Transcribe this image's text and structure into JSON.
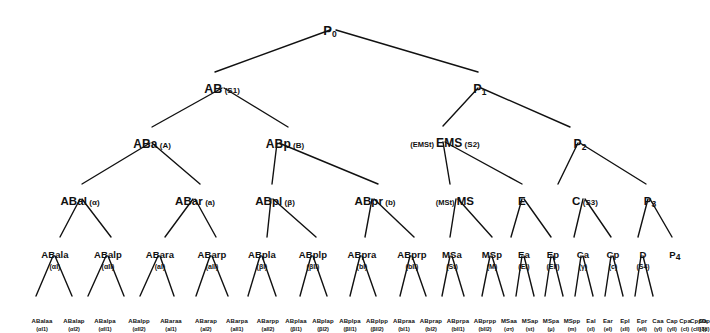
{
  "diagram": {
    "type": "tree",
    "line_color": "#111111",
    "text_color": "#111111",
    "background": "#ffffff"
  },
  "nodes": [
    {
      "id": "P0",
      "label": "P",
      "sub": "0",
      "alias": "",
      "alias_pre": "",
      "x": 330,
      "y": 22,
      "level": 0
    },
    {
      "id": "AB",
      "label": "AB",
      "sub": "",
      "alias": "(S1)",
      "alias_pre": "",
      "x": 222,
      "y": 80,
      "level": 1
    },
    {
      "id": "P1",
      "label": "P",
      "sub": "1",
      "alias": "",
      "alias_pre": "",
      "x": 480,
      "y": 80,
      "level": 1
    },
    {
      "id": "ABa",
      "label": "ABa",
      "sub": "",
      "alias": "(A)",
      "alias_pre": "",
      "x": 152,
      "y": 135,
      "level": 2
    },
    {
      "id": "ABp",
      "label": "ABp",
      "sub": "",
      "alias": "(B)",
      "alias_pre": "",
      "x": 285,
      "y": 135,
      "level": 2
    },
    {
      "id": "EMS",
      "label": "EMS",
      "sub": "",
      "alias": "(S2)",
      "alias_pre": "(EMSt)",
      "x": 445,
      "y": 134,
      "level": 2
    },
    {
      "id": "P2",
      "label": "P",
      "sub": "2",
      "alias": "",
      "alias_pre": "",
      "x": 580,
      "y": 135,
      "level": 2
    },
    {
      "id": "ABal",
      "label": "ABal",
      "sub": "",
      "alias": "(α)",
      "alias_pre": "",
      "x": 80,
      "y": 192,
      "level": 3
    },
    {
      "id": "ABar",
      "label": "ABar",
      "sub": "",
      "alias": "(a)",
      "alias_pre": "",
      "x": 195,
      "y": 192,
      "level": 3
    },
    {
      "id": "ABpl",
      "label": "ABpl",
      "sub": "",
      "alias": "(β)",
      "alias_pre": "",
      "x": 275,
      "y": 192,
      "level": 3
    },
    {
      "id": "ABpr",
      "label": "ABpr",
      "sub": "",
      "alias": "(b)",
      "alias_pre": "",
      "x": 375,
      "y": 192,
      "level": 3
    },
    {
      "id": "MS",
      "label": "MS",
      "sub": "",
      "alias": "",
      "alias_pre": "(MSt)",
      "x": 455,
      "y": 192,
      "level": 3
    },
    {
      "id": "E",
      "label": "E",
      "sub": "",
      "alias": "",
      "alias_pre": "",
      "x": 522,
      "y": 192,
      "level": 3
    },
    {
      "id": "C",
      "label": "C",
      "sub": "",
      "alias": "(S3)",
      "alias_pre": "",
      "x": 585,
      "y": 192,
      "level": 3
    },
    {
      "id": "P3",
      "label": "P",
      "sub": "3",
      "alias": "",
      "alias_pre": "",
      "x": 650,
      "y": 192,
      "level": 3
    },
    {
      "id": "ABala",
      "label": "ABala",
      "sub": "",
      "alias": "(αI)",
      "alias_pre": "",
      "x": 55,
      "y": 245,
      "level": 4
    },
    {
      "id": "ABalp",
      "label": "ABalp",
      "sub": "",
      "alias": "(αII)",
      "alias_pre": "",
      "x": 108,
      "y": 245,
      "level": 4
    },
    {
      "id": "ABara",
      "label": "ABara",
      "sub": "",
      "alias": "(aI)",
      "alias_pre": "",
      "x": 160,
      "y": 245,
      "level": 4
    },
    {
      "id": "ABarp",
      "label": "ABarp",
      "sub": "",
      "alias": "(aII)",
      "alias_pre": "",
      "x": 212,
      "y": 245,
      "level": 4
    },
    {
      "id": "ABpla",
      "label": "ABpla",
      "sub": "",
      "alias": "(βI)",
      "alias_pre": "",
      "x": 262,
      "y": 245,
      "level": 4
    },
    {
      "id": "ABplp",
      "label": "ABplp",
      "sub": "",
      "alias": "(βII)",
      "alias_pre": "",
      "x": 313,
      "y": 245,
      "level": 4
    },
    {
      "id": "ABpra",
      "label": "ABpra",
      "sub": "",
      "alias": "(bI)",
      "alias_pre": "",
      "x": 362,
      "y": 245,
      "level": 4
    },
    {
      "id": "ABprp",
      "label": "ABprp",
      "sub": "",
      "alias": "(bII)",
      "alias_pre": "",
      "x": 412,
      "y": 245,
      "level": 4
    },
    {
      "id": "MSa",
      "label": "MSa",
      "sub": "",
      "alias": "(St)",
      "alias_pre": "",
      "x": 452,
      "y": 245,
      "level": 4
    },
    {
      "id": "MSp",
      "label": "MSp",
      "sub": "",
      "alias": "(M)",
      "alias_pre": "",
      "x": 492,
      "y": 245,
      "level": 4
    },
    {
      "id": "Ea",
      "label": "Ea",
      "sub": "",
      "alias": "(EI)",
      "alias_pre": "",
      "x": 524,
      "y": 245,
      "level": 4
    },
    {
      "id": "Ep",
      "label": "Ep",
      "sub": "",
      "alias": "(EII)",
      "alias_pre": "",
      "x": 553,
      "y": 245,
      "level": 4
    },
    {
      "id": "Ca",
      "label": "Ca",
      "sub": "",
      "alias": "(γ)",
      "alias_pre": "",
      "x": 583,
      "y": 245,
      "level": 4
    },
    {
      "id": "Cp",
      "label": "Cp",
      "sub": "",
      "alias": "(c)",
      "alias_pre": "",
      "x": 613,
      "y": 245,
      "level": 4
    },
    {
      "id": "D",
      "label": "D",
      "sub": "",
      "alias": "(S4)",
      "alias_pre": "",
      "x": 643,
      "y": 245,
      "level": 4
    },
    {
      "id": "P4",
      "label": "P",
      "sub": "4",
      "alias": "",
      "alias_pre": "",
      "x": 675,
      "y": 245,
      "level": 4
    },
    {
      "id": "ABalaa",
      "label": "ABalaa",
      "alias": "(αI1)",
      "x": 42,
      "y": 310,
      "level": 5
    },
    {
      "id": "ABalap",
      "label": "ABalap",
      "alias": "(αI2)",
      "x": 74,
      "y": 310,
      "level": 5
    },
    {
      "id": "ABalpa",
      "label": "ABalpa",
      "alias": "(αII1)",
      "x": 105,
      "y": 310,
      "level": 5
    },
    {
      "id": "ABalpp",
      "label": "ABalpp",
      "alias": "(αII2)",
      "x": 139,
      "y": 310,
      "level": 5
    },
    {
      "id": "ABaraa",
      "label": "ABaraa",
      "alias": "(aI1)",
      "x": 171,
      "y": 310,
      "level": 5
    },
    {
      "id": "ABarap",
      "label": "ABarap",
      "alias": "(aI2)",
      "x": 206,
      "y": 310,
      "level": 5
    },
    {
      "id": "ABarpa",
      "label": "ABarpa",
      "alias": "(aII1)",
      "x": 237,
      "y": 310,
      "level": 5
    },
    {
      "id": "ABarpp",
      "label": "ABarpp",
      "alias": "(aII2)",
      "x": 268,
      "y": 310,
      "level": 5
    },
    {
      "id": "ABplaa",
      "label": "ABplaa",
      "alias": "(βI1)",
      "x": 296,
      "y": 310,
      "level": 5
    },
    {
      "id": "ABplap",
      "label": "ABplap",
      "alias": "(βI2)",
      "x": 323,
      "y": 310,
      "level": 5
    },
    {
      "id": "ABplpa",
      "label": "ABplpa",
      "alias": "(βII1)",
      "x": 350,
      "y": 310,
      "level": 5
    },
    {
      "id": "ABplpp",
      "label": "ABplpp",
      "alias": "(βII2)",
      "x": 377,
      "y": 310,
      "level": 5
    },
    {
      "id": "ABpraa",
      "label": "ABpraa",
      "alias": "(bI1)",
      "x": 404,
      "y": 310,
      "level": 5
    },
    {
      "id": "ABprap",
      "label": "ABprap",
      "alias": "(bI2)",
      "x": 431,
      "y": 310,
      "level": 5
    },
    {
      "id": "ABprpa",
      "label": "ABprpa",
      "alias": "(bII1)",
      "x": 458,
      "y": 310,
      "level": 5
    },
    {
      "id": "ABprpp",
      "label": "ABprpp",
      "alias": "(bII2)",
      "x": 485,
      "y": 310,
      "level": 5
    },
    {
      "id": "MSaa",
      "label": "MSaa",
      "alias": "(στ)",
      "x": 509,
      "y": 310,
      "level": 5
    },
    {
      "id": "MSap",
      "label": "MSap",
      "alias": "(st)",
      "x": 530,
      "y": 310,
      "level": 5
    },
    {
      "id": "MSpa",
      "label": "MSpa",
      "alias": "(μ)",
      "x": 551,
      "y": 310,
      "level": 5
    },
    {
      "id": "MSpp",
      "label": "MSpp",
      "alias": "(m)",
      "x": 572,
      "y": 310,
      "level": 5
    },
    {
      "id": "Eal",
      "label": "Eal",
      "alias": "(εI)",
      "x": 591,
      "y": 310,
      "level": 5
    },
    {
      "id": "Ear",
      "label": "Ear",
      "alias": "(eI)",
      "x": 608,
      "y": 310,
      "level": 5
    },
    {
      "id": "Epl",
      "label": "Epl",
      "alias": "(εII)",
      "x": 625,
      "y": 310,
      "level": 5
    },
    {
      "id": "Epr",
      "label": "Epr",
      "alias": "(eII)",
      "x": 642,
      "y": 310,
      "level": 5
    },
    {
      "id": "Caa",
      "label": "Caa",
      "alias": "(γI)",
      "x": 658,
      "y": 310,
      "level": 5
    },
    {
      "id": "Cap",
      "label": "Cap",
      "alias": "(γII)",
      "x": 672,
      "y": 310,
      "level": 5
    },
    {
      "id": "Cpa",
      "label": "Cpa",
      "alias": "(cI)",
      "x": 685,
      "y": 310,
      "level": 5
    },
    {
      "id": "Cpp",
      "label": "Cpp",
      "alias": "(cII)",
      "x": 696,
      "y": 310,
      "level": 5
    },
    {
      "id": "Da",
      "label": "Da",
      "alias": "(δ)",
      "x": 703,
      "y": 310,
      "level": 5
    },
    {
      "id": "Dp",
      "label": "Dp",
      "alias": "(d)",
      "x": 706,
      "y": 310,
      "level": 5
    }
  ],
  "edges": [
    {
      "from": "P0",
      "to": "AB",
      "x1": 330,
      "y1": 30,
      "x2": 215,
      "y2": 72
    },
    {
      "from": "P0",
      "to": "P1",
      "x1": 336,
      "y1": 30,
      "x2": 478,
      "y2": 72
    },
    {
      "from": "AB",
      "to": "ABa",
      "x1": 222,
      "y1": 88,
      "x2": 152,
      "y2": 127
    },
    {
      "from": "AB",
      "to": "ABp",
      "x1": 224,
      "y1": 88,
      "x2": 288,
      "y2": 127
    },
    {
      "from": "P1",
      "to": "EMS",
      "x1": 478,
      "y1": 88,
      "x2": 443,
      "y2": 126
    },
    {
      "from": "P1",
      "to": "P2",
      "x1": 481,
      "y1": 88,
      "x2": 570,
      "y2": 127
    },
    {
      "from": "ABa",
      "to": "ABal",
      "x1": 150,
      "y1": 143,
      "x2": 82,
      "y2": 184
    },
    {
      "from": "ABa",
      "to": "ABar",
      "x1": 152,
      "y1": 143,
      "x2": 200,
      "y2": 184
    },
    {
      "from": "ABp",
      "to": "ABpl",
      "x1": 277,
      "y1": 143,
      "x2": 272,
      "y2": 184
    },
    {
      "from": "ABp",
      "to": "ABpr",
      "x1": 279,
      "y1": 143,
      "x2": 378,
      "y2": 184
    },
    {
      "from": "EMS",
      "to": "MS",
      "x1": 443,
      "y1": 142,
      "x2": 450,
      "y2": 184
    },
    {
      "from": "EMS",
      "to": "E",
      "x1": 445,
      "y1": 142,
      "x2": 522,
      "y2": 184
    },
    {
      "from": "P2",
      "to": "C",
      "x1": 578,
      "y1": 143,
      "x2": 558,
      "y2": 184
    },
    {
      "from": "P2",
      "to": "P3",
      "x1": 580,
      "y1": 143,
      "x2": 646,
      "y2": 184
    },
    {
      "from": "ABal",
      "to": "ABala",
      "x1": 80,
      "y1": 199,
      "x2": 60,
      "y2": 237
    },
    {
      "from": "ABal",
      "to": "ABalp",
      "x1": 82,
      "y1": 199,
      "x2": 111,
      "y2": 237
    },
    {
      "from": "ABar",
      "to": "ABara",
      "x1": 193,
      "y1": 199,
      "x2": 165,
      "y2": 237
    },
    {
      "from": "ABar",
      "to": "ABarp",
      "x1": 195,
      "y1": 199,
      "x2": 216,
      "y2": 237
    },
    {
      "from": "ABpl",
      "to": "ABpla",
      "x1": 271,
      "y1": 199,
      "x2": 267,
      "y2": 237
    },
    {
      "from": "ABpl",
      "to": "ABplp",
      "x1": 273,
      "y1": 199,
      "x2": 316,
      "y2": 237
    },
    {
      "from": "ABpr",
      "to": "ABpra",
      "x1": 372,
      "y1": 199,
      "x2": 365,
      "y2": 237
    },
    {
      "from": "ABpr",
      "to": "ABprp",
      "x1": 374,
      "y1": 199,
      "x2": 414,
      "y2": 237
    },
    {
      "from": "MS",
      "to": "MSa",
      "x1": 456,
      "y1": 199,
      "x2": 450,
      "y2": 237
    },
    {
      "from": "MS",
      "to": "MSp",
      "x1": 458,
      "y1": 199,
      "x2": 492,
      "y2": 237
    },
    {
      "from": "E",
      "to": "Ea",
      "x1": 522,
      "y1": 199,
      "x2": 511,
      "y2": 237
    },
    {
      "from": "E",
      "to": "Ep",
      "x1": 524,
      "y1": 199,
      "x2": 551,
      "y2": 237
    },
    {
      "from": "C",
      "to": "Ca",
      "x1": 583,
      "y1": 199,
      "x2": 574,
      "y2": 237
    },
    {
      "from": "C",
      "to": "Cp",
      "x1": 585,
      "y1": 199,
      "x2": 611,
      "y2": 237
    },
    {
      "from": "P3",
      "to": "D",
      "x1": 648,
      "y1": 199,
      "x2": 638,
      "y2": 237
    },
    {
      "from": "P3",
      "to": "P4",
      "x1": 650,
      "y1": 199,
      "x2": 672,
      "y2": 237
    },
    {
      "from": "ABala",
      "to": "ABalaa",
      "x1": 53,
      "y1": 256,
      "x2": 36,
      "y2": 296
    },
    {
      "from": "ABala",
      "to": "ABalap",
      "x1": 55,
      "y1": 256,
      "x2": 72,
      "y2": 296
    },
    {
      "from": "ABalp",
      "to": "ABalpa",
      "x1": 106,
      "y1": 256,
      "x2": 88,
      "y2": 296
    },
    {
      "from": "ABalp",
      "to": "ABalpp",
      "x1": 108,
      "y1": 256,
      "x2": 124,
      "y2": 296
    },
    {
      "from": "ABara",
      "to": "ABaraa",
      "x1": 158,
      "y1": 256,
      "x2": 140,
      "y2": 296
    },
    {
      "from": "ABara",
      "to": "ABarap",
      "x1": 160,
      "y1": 256,
      "x2": 174,
      "y2": 296
    },
    {
      "from": "ABarp",
      "to": "ABarpa",
      "x1": 210,
      "y1": 256,
      "x2": 196,
      "y2": 296
    },
    {
      "from": "ABarp",
      "to": "ABarpp",
      "x1": 212,
      "y1": 256,
      "x2": 228,
      "y2": 296
    },
    {
      "from": "ABpla",
      "to": "ABplaa",
      "x1": 260,
      "y1": 256,
      "x2": 248,
      "y2": 296
    },
    {
      "from": "ABpla",
      "to": "ABplap",
      "x1": 262,
      "y1": 256,
      "x2": 276,
      "y2": 296
    },
    {
      "from": "ABplp",
      "to": "ABplpa",
      "x1": 311,
      "y1": 256,
      "x2": 300,
      "y2": 296
    },
    {
      "from": "ABplp",
      "to": "ABplpp",
      "x1": 313,
      "y1": 256,
      "x2": 327,
      "y2": 296
    },
    {
      "from": "ABpra",
      "to": "ABpraa",
      "x1": 360,
      "y1": 256,
      "x2": 350,
      "y2": 296
    },
    {
      "from": "ABpra",
      "to": "ABprap",
      "x1": 362,
      "y1": 256,
      "x2": 376,
      "y2": 296
    },
    {
      "from": "ABprp",
      "to": "ABprpa",
      "x1": 410,
      "y1": 256,
      "x2": 400,
      "y2": 296
    },
    {
      "from": "ABprp",
      "to": "ABprpp",
      "x1": 412,
      "y1": 256,
      "x2": 426,
      "y2": 296
    },
    {
      "from": "MSa",
      "to": "MSaa",
      "x1": 450,
      "y1": 256,
      "x2": 442,
      "y2": 296
    },
    {
      "from": "MSa",
      "to": "MSap",
      "x1": 452,
      "y1": 256,
      "x2": 464,
      "y2": 296
    },
    {
      "from": "MSp",
      "to": "MSpa",
      "x1": 490,
      "y1": 256,
      "x2": 482,
      "y2": 296
    },
    {
      "from": "MSp",
      "to": "MSpp",
      "x1": 492,
      "y1": 256,
      "x2": 504,
      "y2": 296
    },
    {
      "from": "Ea",
      "to": "Eal",
      "x1": 522,
      "y1": 256,
      "x2": 516,
      "y2": 296
    },
    {
      "from": "Ea",
      "to": "Ear",
      "x1": 524,
      "y1": 256,
      "x2": 534,
      "y2": 296
    },
    {
      "from": "Ep",
      "to": "Epl",
      "x1": 551,
      "y1": 256,
      "x2": 545,
      "y2": 296
    },
    {
      "from": "Ep",
      "to": "Epr",
      "x1": 553,
      "y1": 256,
      "x2": 563,
      "y2": 296
    },
    {
      "from": "Ca",
      "to": "Caa",
      "x1": 581,
      "y1": 256,
      "x2": 575,
      "y2": 296
    },
    {
      "from": "Ca",
      "to": "Cap",
      "x1": 583,
      "y1": 256,
      "x2": 593,
      "y2": 296
    },
    {
      "from": "Cp",
      "to": "Cpa",
      "x1": 611,
      "y1": 256,
      "x2": 605,
      "y2": 296
    },
    {
      "from": "Cp",
      "to": "Cpp",
      "x1": 613,
      "y1": 256,
      "x2": 623,
      "y2": 296
    },
    {
      "from": "D",
      "to": "Da",
      "x1": 641,
      "y1": 256,
      "x2": 635,
      "y2": 296
    },
    {
      "from": "D",
      "to": "Dp",
      "x1": 643,
      "y1": 256,
      "x2": 653,
      "y2": 296
    }
  ]
}
